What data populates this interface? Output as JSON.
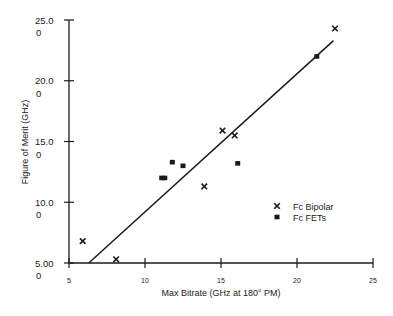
{
  "chart_data": {
    "type": "scatter",
    "title": "",
    "xlabel": "Max Bitrate (GHz at 180° PM)",
    "ylabel": "Figure of Merit (GHz)",
    "xlim": [
      5,
      25
    ],
    "ylim": [
      5,
      25
    ],
    "xticks": [
      5,
      10,
      15,
      20,
      25
    ],
    "xtick_labels": [
      "5",
      "10",
      "15",
      "20",
      "25"
    ],
    "yticks": [
      5,
      10,
      15,
      20,
      25
    ],
    "ytick_labels": [
      [
        "5.00",
        "0"
      ],
      [
        "10.0",
        "0"
      ],
      [
        "15.0",
        "0"
      ],
      [
        "20.0",
        "0"
      ],
      [
        "25.0",
        "0"
      ]
    ],
    "grid": false,
    "legend_position": "center-right",
    "series": [
      {
        "name": "Fc  Bipolar",
        "marker": "x",
        "points": [
          {
            "x": 5.9,
            "y": 6.8
          },
          {
            "x": 8.1,
            "y": 5.3
          },
          {
            "x": 13.9,
            "y": 11.3
          },
          {
            "x": 15.1,
            "y": 15.9
          },
          {
            "x": 15.9,
            "y": 15.5
          },
          {
            "x": 22.5,
            "y": 24.3
          }
        ]
      },
      {
        "name": "Fc FETs",
        "marker": "square",
        "points": [
          {
            "x": 11.1,
            "y": 12.0
          },
          {
            "x": 11.3,
            "y": 12.0
          },
          {
            "x": 11.8,
            "y": 13.3
          },
          {
            "x": 12.5,
            "y": 13.0
          },
          {
            "x": 16.1,
            "y": 13.2
          },
          {
            "x": 21.3,
            "y": 22.0
          }
        ]
      }
    ],
    "fit_line": {
      "x": [
        6.3,
        22.4
      ],
      "y": [
        5.0,
        23.3
      ]
    }
  }
}
